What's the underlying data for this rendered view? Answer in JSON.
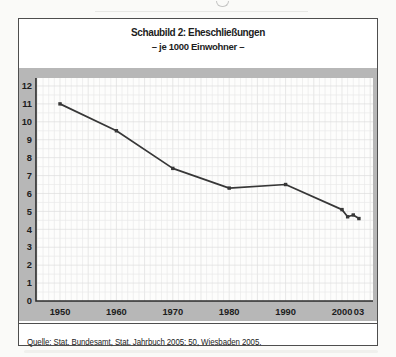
{
  "figure": {
    "title": "Schaubild 2: Eheschließungen",
    "subtitle": "– je 1000 Einwohner –",
    "source_line": "Quelle: Stat. Bundesamt, Stat. Jahrbuch 2005: 50, Wiesbaden 2005."
  },
  "chart_data": {
    "type": "line",
    "title": "Schaubild 2: Eheschließungen",
    "subtitle": "– je 1000 Einwohner –",
    "x": [
      1950,
      1960,
      1970,
      1980,
      1990,
      2000,
      2001,
      2002,
      2003
    ],
    "values": [
      11.0,
      9.5,
      7.4,
      6.3,
      6.5,
      5.1,
      4.7,
      4.8,
      4.6
    ],
    "series_name": "Eheschließungen je 1000 Einwohner",
    "x_ticks": [
      1950,
      1960,
      1970,
      1980,
      1990,
      2000,
      2003
    ],
    "x_tick_labels": [
      "1950",
      "1960",
      "1970",
      "1980",
      "1990",
      "2000",
      "03"
    ],
    "y_ticks": [
      0,
      1,
      2,
      3,
      4,
      5,
      6,
      7,
      8,
      9,
      10,
      11,
      12
    ],
    "ylim": [
      0,
      12.4
    ],
    "xlim": [
      1945.7,
      2005.6
    ],
    "grid": "fine grid: vertical line per year, horizontal line per 0.5 units",
    "legend": "none",
    "marker": "square",
    "xlabel": "",
    "ylabel": ""
  },
  "colors": {
    "band_gray": "#b7b7b7",
    "plot_bg": "#fdfdfc",
    "grid_minor": "#eaeaea",
    "grid_major": "#dedede",
    "axis": "#2b2b2b",
    "line": "#373737",
    "box_border": "#4e4e4e",
    "text": "#1d1d1d"
  }
}
